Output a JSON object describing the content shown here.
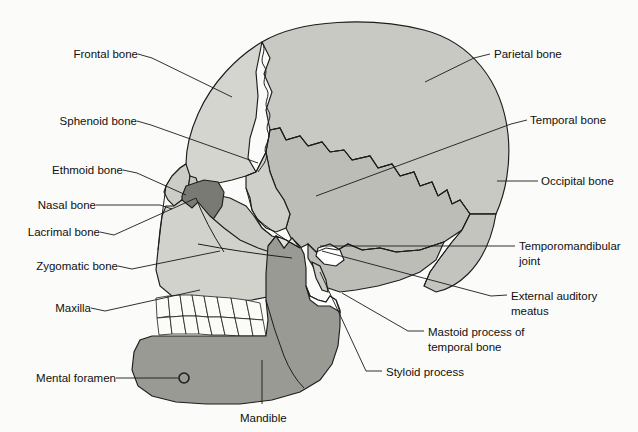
{
  "figure": {
    "background_color": "#fbfbf9",
    "line_color": "#1d1d1d",
    "text_color": "#101010"
  },
  "palette": {
    "parietal": "#c9c9c4",
    "frontal": "#d5d5d0",
    "temporal": "#bdbdb8",
    "occipital": "#c4c4bf",
    "sphenoid": "#cfcfca",
    "maxilla": "#d2d2cd",
    "zygomatic": "#cbcbc6",
    "nasal": "#cdcdc8",
    "lacrimal": "#c6c6c1",
    "ethmoid_orbit": "#7a7a75",
    "mandible": "#9a9a95",
    "teeth": "#fbfbf8",
    "tmj_gap": "#ffffff"
  },
  "labels": {
    "left": [
      {
        "id": "frontal-bone",
        "text": "Frontal bone",
        "x": 58,
        "y": 58,
        "lead": [
          [
            138,
            54
          ],
          [
            152,
            58
          ],
          [
            232,
            97
          ]
        ]
      },
      {
        "id": "sphenoid-bone",
        "text": "Sphenoid bone",
        "x": 35,
        "y": 124,
        "lead": [
          [
            137,
            121
          ],
          [
            151,
            125
          ],
          [
            258,
            163
          ]
        ]
      },
      {
        "id": "ethmoid-bone",
        "text": "Ethmoid bone",
        "x": 22,
        "y": 173,
        "lead": [
          [
            123,
            170
          ],
          [
            137,
            173
          ],
          [
            186,
            195
          ]
        ]
      },
      {
        "id": "nasal-bone",
        "text": "Nasal bone",
        "x": 16,
        "y": 208,
        "lead": [
          [
            96,
            205
          ],
          [
            160,
            205
          ],
          [
            172,
            209
          ]
        ]
      },
      {
        "id": "lacrimal-bone",
        "text": "Lacrimal bone",
        "x": 12,
        "y": 235,
        "lead": [
          [
            100,
            232
          ],
          [
            114,
            235
          ],
          [
            196,
            198
          ]
        ]
      },
      {
        "id": "zygomatic-bone",
        "text": "Zygomatic bone",
        "x": 12,
        "y": 269,
        "lead": [
          [
            118,
            266
          ],
          [
            132,
            269
          ],
          [
            220,
            251
          ]
        ]
      },
      {
        "id": "maxilla",
        "text": "Maxilla",
        "x": 40,
        "y": 311,
        "lead": [
          [
            91,
            308
          ],
          [
            105,
            311
          ],
          [
            200,
            290
          ]
        ]
      },
      {
        "id": "mental-foramen",
        "text": "Mental foramen",
        "x": 19,
        "y": 381,
        "lead": [
          [
            116,
            378
          ],
          [
            178,
            378
          ]
        ]
      }
    ],
    "right": [
      {
        "id": "parietal-bone",
        "text": "Parietal bone",
        "x": 494,
        "y": 57,
        "lead": [
          [
            490,
            54
          ],
          [
            474,
            58
          ],
          [
            425,
            82
          ]
        ]
      },
      {
        "id": "temporal-bone",
        "text": "Temporal bone",
        "x": 530,
        "y": 123,
        "lead": [
          [
            527,
            120
          ],
          [
            511,
            124
          ],
          [
            316,
            196
          ]
        ]
      },
      {
        "id": "occipital-bone",
        "text": "Occipital bone",
        "x": 541,
        "y": 184,
        "lead": [
          [
            538,
            181
          ],
          [
            497,
            181
          ]
        ]
      },
      {
        "id": "external-auditory-meatus",
        "text": "External auditory",
        "text2": "meatus",
        "x": 511,
        "y": 299,
        "lead": [
          [
            507,
            295
          ],
          [
            491,
            296
          ],
          [
            322,
            251
          ]
        ]
      },
      {
        "id": "mastoid-process",
        "text": "Mastoid process of",
        "text2": "temporal bone",
        "x": 428,
        "y": 335,
        "lead": [
          [
            424,
            331
          ],
          [
            408,
            331
          ],
          [
            342,
            293
          ]
        ]
      },
      {
        "id": "styloid-process",
        "text": "Styloid process",
        "x": 386,
        "y": 375,
        "lead": [
          [
            382,
            371
          ],
          [
            366,
            371
          ],
          [
            320,
            272
          ]
        ]
      }
    ],
    "right_two_line": [
      {
        "id": "temporomandibular-joint",
        "text": "Temporomandibular",
        "text2": "joint",
        "x": 519,
        "y": 250,
        "lead": [
          [
            515,
            246
          ],
          [
            320,
            246
          ]
        ]
      }
    ],
    "bottom": [
      {
        "id": "mandible",
        "text": "Mandible",
        "x": 240,
        "y": 418,
        "lead": [
          [
            262,
            404
          ],
          [
            262,
            360
          ]
        ]
      }
    ]
  },
  "bones": [
    {
      "id": "parietal-bone",
      "name": "Parietal bone"
    },
    {
      "id": "frontal-bone",
      "name": "Frontal bone"
    },
    {
      "id": "temporal-bone",
      "name": "Temporal bone"
    },
    {
      "id": "occipital-bone",
      "name": "Occipital bone"
    },
    {
      "id": "sphenoid-bone",
      "name": "Sphenoid bone"
    },
    {
      "id": "ethmoid-bone",
      "name": "Ethmoid bone"
    },
    {
      "id": "nasal-bone",
      "name": "Nasal bone"
    },
    {
      "id": "lacrimal-bone",
      "name": "Lacrimal bone"
    },
    {
      "id": "zygomatic-bone",
      "name": "Zygomatic bone"
    },
    {
      "id": "maxilla",
      "name": "Maxilla"
    },
    {
      "id": "mandible",
      "name": "Mandible"
    }
  ],
  "features": [
    {
      "id": "temporomandibular-joint",
      "name": "Temporomandibular joint"
    },
    {
      "id": "external-auditory-meatus",
      "name": "External auditory meatus"
    },
    {
      "id": "mastoid-process",
      "name": "Mastoid process of temporal bone"
    },
    {
      "id": "styloid-process",
      "name": "Styloid process"
    },
    {
      "id": "mental-foramen",
      "name": "Mental foramen"
    }
  ],
  "teeth": {
    "upper_count": 8,
    "lower_count": 8
  }
}
